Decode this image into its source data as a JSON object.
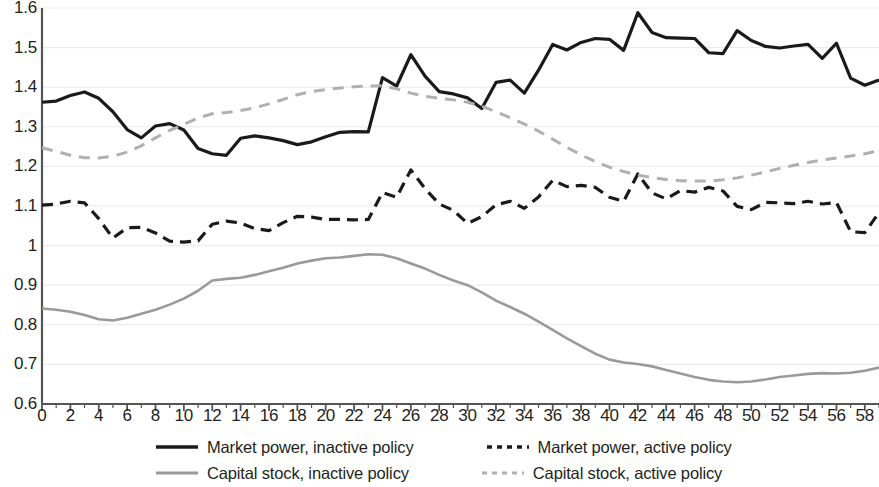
{
  "chart_data": {
    "type": "line",
    "title": "",
    "xlabel": "",
    "ylabel": "",
    "xlim": [
      0,
      59
    ],
    "ylim": [
      0.6,
      1.6
    ],
    "grid": true,
    "legend_position": "bottom",
    "x_tick_labels": [
      "0",
      "2",
      "4",
      "6",
      "8",
      "10",
      "12",
      "14",
      "16",
      "18",
      "20",
      "22",
      "24",
      "26",
      "28",
      "30",
      "32",
      "34",
      "36",
      "38",
      "40",
      "42",
      "44",
      "46",
      "48",
      "50",
      "52",
      "54",
      "56",
      "58"
    ],
    "x_tick_values": [
      0,
      2,
      4,
      6,
      8,
      10,
      12,
      14,
      16,
      18,
      20,
      22,
      24,
      26,
      28,
      30,
      32,
      34,
      36,
      38,
      40,
      42,
      44,
      46,
      48,
      50,
      52,
      54,
      56,
      58
    ],
    "y_tick_labels": [
      "1.6",
      "1.5",
      "1.4",
      "1.3",
      "1.2",
      "1.1",
      "1",
      "0.9",
      "0.8",
      "0.7",
      "0.6"
    ],
    "y_tick_values": [
      1.6,
      1.5,
      1.4,
      1.3,
      1.2,
      1.1,
      1.0,
      0.9,
      0.8,
      0.7,
      0.6
    ],
    "x": [
      0,
      1,
      2,
      3,
      4,
      5,
      6,
      7,
      8,
      9,
      10,
      11,
      12,
      13,
      14,
      15,
      16,
      17,
      18,
      19,
      20,
      21,
      22,
      23,
      24,
      25,
      26,
      27,
      28,
      29,
      30,
      31,
      32,
      33,
      34,
      35,
      36,
      37,
      38,
      39,
      40,
      41,
      42,
      43,
      44,
      45,
      46,
      47,
      48,
      49,
      50,
      51,
      52,
      53,
      54,
      55,
      56,
      57,
      58,
      59
    ],
    "series": [
      {
        "name": "Market power, inactive policy",
        "style": "solid",
        "color": "#1a1a1a",
        "width": 3.2,
        "values": [
          1.362,
          1.365,
          1.379,
          1.388,
          1.372,
          1.338,
          1.293,
          1.272,
          1.302,
          1.308,
          1.292,
          1.245,
          1.232,
          1.228,
          1.271,
          1.277,
          1.272,
          1.265,
          1.255,
          1.262,
          1.275,
          1.286,
          1.288,
          1.287,
          1.424,
          1.403,
          1.482,
          1.428,
          1.389,
          1.383,
          1.373,
          1.346,
          1.412,
          1.418,
          1.385,
          1.443,
          1.508,
          1.494,
          1.513,
          1.523,
          1.521,
          1.493,
          1.588,
          1.538,
          1.525,
          1.524,
          1.523,
          1.487,
          1.485,
          1.543,
          1.518,
          1.503,
          1.499,
          1.504,
          1.508,
          1.473,
          1.511,
          1.423,
          1.405,
          1.418
        ]
      },
      {
        "name": "Market power, active policy",
        "style": "dashed",
        "color": "#1a1a1a",
        "width": 3.2,
        "values": [
          1.102,
          1.105,
          1.112,
          1.108,
          1.068,
          1.019,
          1.045,
          1.046,
          1.032,
          1.011,
          1.009,
          1.012,
          1.054,
          1.062,
          1.057,
          1.043,
          1.038,
          1.058,
          1.074,
          1.072,
          1.066,
          1.066,
          1.065,
          1.066,
          1.134,
          1.122,
          1.191,
          1.144,
          1.105,
          1.089,
          1.056,
          1.073,
          1.103,
          1.112,
          1.094,
          1.123,
          1.165,
          1.149,
          1.152,
          1.147,
          1.122,
          1.112,
          1.181,
          1.133,
          1.118,
          1.139,
          1.135,
          1.147,
          1.138,
          1.099,
          1.091,
          1.109,
          1.108,
          1.106,
          1.112,
          1.105,
          1.109,
          1.035,
          1.033,
          1.083
        ]
      },
      {
        "name": "Capital stock, inactive policy",
        "style": "solid",
        "color": "#9a9a9a",
        "width": 2.6,
        "values": [
          0.841,
          0.838,
          0.833,
          0.825,
          0.814,
          0.811,
          0.818,
          0.828,
          0.838,
          0.851,
          0.866,
          0.886,
          0.912,
          0.916,
          0.919,
          0.926,
          0.935,
          0.944,
          0.955,
          0.962,
          0.968,
          0.97,
          0.974,
          0.978,
          0.977,
          0.968,
          0.955,
          0.942,
          0.926,
          0.912,
          0.9,
          0.882,
          0.861,
          0.845,
          0.828,
          0.808,
          0.787,
          0.766,
          0.746,
          0.727,
          0.712,
          0.705,
          0.701,
          0.695,
          0.686,
          0.677,
          0.668,
          0.661,
          0.657,
          0.655,
          0.657,
          0.662,
          0.668,
          0.672,
          0.676,
          0.678,
          0.677,
          0.679,
          0.684,
          0.692
        ]
      },
      {
        "name": "Capital stock, active policy",
        "style": "dashed",
        "color": "#b0b0b0",
        "width": 3.0,
        "values": [
          1.247,
          1.238,
          1.228,
          1.222,
          1.221,
          1.226,
          1.236,
          1.252,
          1.272,
          1.291,
          1.306,
          1.322,
          1.333,
          1.336,
          1.341,
          1.348,
          1.358,
          1.369,
          1.381,
          1.389,
          1.394,
          1.398,
          1.401,
          1.403,
          1.404,
          1.396,
          1.385,
          1.377,
          1.372,
          1.368,
          1.362,
          1.352,
          1.338,
          1.323,
          1.307,
          1.289,
          1.269,
          1.248,
          1.229,
          1.212,
          1.198,
          1.187,
          1.178,
          1.172,
          1.167,
          1.164,
          1.163,
          1.163,
          1.166,
          1.171,
          1.178,
          1.186,
          1.195,
          1.203,
          1.21,
          1.216,
          1.221,
          1.226,
          1.232,
          1.24
        ]
      }
    ]
  },
  "legend": {
    "items": [
      {
        "label": "Market power, inactive policy",
        "swatch": "solid-black-line-swatch"
      },
      {
        "label": "Market power, active policy",
        "swatch": "dashed-black-line-swatch"
      },
      {
        "label": "Capital stock, inactive policy",
        "swatch": "solid-grey-line-swatch"
      },
      {
        "label": "Capital stock, active policy",
        "swatch": "dashed-grey-line-swatch"
      }
    ]
  }
}
